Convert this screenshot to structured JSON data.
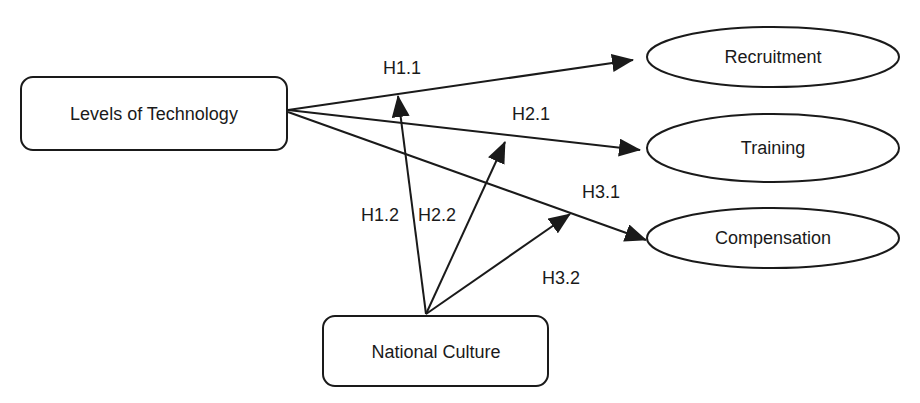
{
  "diagram": {
    "nodes": {
      "technology": {
        "label": "Levels of Technology",
        "shape": "rounded-rect"
      },
      "culture": {
        "label": "National Culture",
        "shape": "rounded-rect"
      },
      "recruitment": {
        "label": "Recruitment",
        "shape": "ellipse"
      },
      "training": {
        "label": "Training",
        "shape": "ellipse"
      },
      "compensation": {
        "label": "Compensation",
        "shape": "ellipse"
      }
    },
    "edges": {
      "h1_1": {
        "label": "H1.1",
        "from": "Levels of Technology",
        "to": "Recruitment"
      },
      "h2_1": {
        "label": "H2.1",
        "from": "Levels of Technology",
        "to": "Training"
      },
      "h3_1": {
        "label": "H3.1",
        "from": "Levels of Technology",
        "to": "Compensation"
      },
      "h1_2": {
        "label": "H1.2",
        "from": "National Culture",
        "to": "H1.1 path"
      },
      "h2_2": {
        "label": "H2.2",
        "from": "National Culture",
        "to": "H2.1 path"
      },
      "h3_2": {
        "label": "H3.2",
        "from": "National Culture",
        "to": "H3.1 path"
      }
    },
    "colors": {
      "stroke": "#1a1a1a",
      "background": "#ffffff"
    }
  }
}
